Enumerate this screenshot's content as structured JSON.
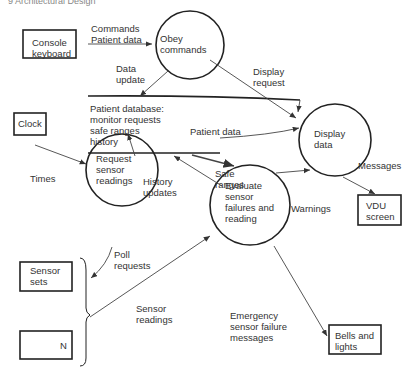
{
  "header": "9   Architectural Design",
  "externals": {
    "console": "Console\nkeyboard",
    "clock": "Clock",
    "sensor_sets": "Sensor\nsets",
    "sensor_n": "N",
    "vdu": "VDU\nscreen",
    "bells": "Bells and\nlights"
  },
  "processes": {
    "obey": "Obey\ncommands",
    "display": "Display\ndata",
    "request": "Request\nsensor\nreadings",
    "evaluate": "Evaluate\nsensor\nfailures and\nreading"
  },
  "datastore": "Patient database:\nmonitor requests\nsafe ranges\nhistory",
  "flows": {
    "commands": "Commands\nPatient data",
    "data_update": "Data\nupdate",
    "display_request": "Display\nrequest",
    "patient_data": "Patient data",
    "times": "Times",
    "history_updates": "History\nupdates",
    "safe_ranges": "Safe\nranges",
    "warnings": "Warnings",
    "messages": "Messages",
    "poll_requests": "Poll\nrequests",
    "sensor_readings": "Sensor\nreadings",
    "emergency": "Emergency\nsensor failure\nmessages"
  }
}
